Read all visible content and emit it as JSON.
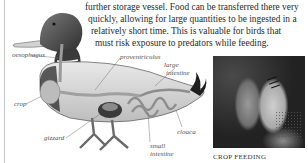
{
  "paragraph": {
    "lines": [
      "further storage vessel. Food can be transferred there very",
      "quickly, allowing for large quantities to be ingested in a",
      "relatively short time. This is valuable for birds that",
      "must risk exposure to predators while feeding."
    ]
  },
  "diagram": {
    "labels": {
      "oesophagus": "oesophagus",
      "proventriculus": "proventriculus",
      "large_intestine_1": "large",
      "large_intestine_2": "intestine",
      "crop": "crop",
      "gizzard": "gizzard",
      "cloaca": "cloaca",
      "small_intestine_1": "small",
      "small_intestine_2": "intestine"
    }
  },
  "photo": {
    "caption": "CROP FEEDING",
    "subject": "budgerigars crop feeding"
  },
  "colors": {
    "text": "#2a2a2a",
    "label": "#555555",
    "background": "#ffffff"
  }
}
